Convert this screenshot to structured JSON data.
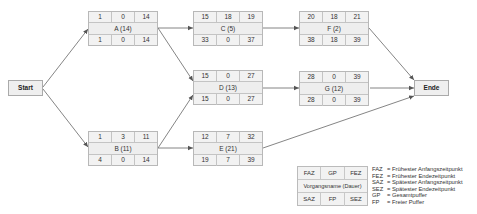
{
  "diagram": {
    "type": "network-plan",
    "start_label": "Start",
    "end_label": "Ende",
    "nodes": {
      "A": {
        "name": "A (14)",
        "faz": "1",
        "gp": "0",
        "fez": "14",
        "saz": "1",
        "fp": "0",
        "sez": "14"
      },
      "B": {
        "name": "B (11)",
        "faz": "1",
        "gp": "3",
        "fez": "11",
        "saz": "4",
        "fp": "0",
        "sez": "14"
      },
      "C": {
        "name": "C (5)",
        "faz": "15",
        "gp": "18",
        "fez": "19",
        "saz": "33",
        "fp": "0",
        "sez": "37"
      },
      "D": {
        "name": "D (13)",
        "faz": "15",
        "gp": "0",
        "fez": "27",
        "saz": "15",
        "fp": "0",
        "sez": "27"
      },
      "E": {
        "name": "E (21)",
        "faz": "12",
        "gp": "7",
        "fez": "32",
        "saz": "19",
        "fp": "7",
        "sez": "39"
      },
      "F": {
        "name": "F (2)",
        "faz": "20",
        "gp": "18",
        "fez": "21",
        "saz": "38",
        "fp": "18",
        "sez": "39"
      },
      "G": {
        "name": "G (12)",
        "faz": "28",
        "gp": "0",
        "fez": "39",
        "saz": "28",
        "fp": "0",
        "sez": "39"
      }
    },
    "edges": [
      [
        "Start",
        "A"
      ],
      [
        "Start",
        "B"
      ],
      [
        "A",
        "C"
      ],
      [
        "A",
        "D"
      ],
      [
        "B",
        "D"
      ],
      [
        "B",
        "E"
      ],
      [
        "C",
        "F"
      ],
      [
        "D",
        "G"
      ],
      [
        "F",
        "Ende"
      ],
      [
        "G",
        "Ende"
      ],
      [
        "E",
        "Ende"
      ]
    ]
  },
  "legend": {
    "box": {
      "faz": "FAZ",
      "gp": "GP",
      "fez": "FEZ",
      "name": "Vorgangsname (Dauer)",
      "saz": "SAZ",
      "fp": "FP",
      "sez": "SEZ"
    },
    "entries": [
      {
        "abbr": "FAZ",
        "text": "= Frühester Anfangszeitpunkt"
      },
      {
        "abbr": "FEZ",
        "text": "= Frühester Endezeitpunkt"
      },
      {
        "abbr": "SAZ",
        "text": "= Spätester Anfangszeitpunkt"
      },
      {
        "abbr": "SEZ",
        "text": "= Spätester Endezeitpunkt"
      },
      {
        "abbr": "GP",
        "text": "= Gesamtpuffer"
      },
      {
        "abbr": "FP",
        "text": "= Freier Puffer"
      }
    ]
  }
}
